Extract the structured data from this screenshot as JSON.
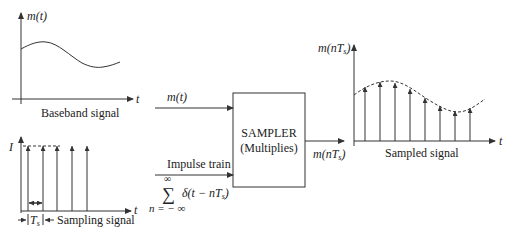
{
  "baseband": {
    "y_label": "m(t)",
    "x_label": "t",
    "caption": "Baseband signal"
  },
  "sampling": {
    "amplitude_label": "I",
    "x_label": "t",
    "period_label": "T",
    "period_sub": "s",
    "caption": "Sampling signal"
  },
  "inputs": {
    "signal_label": "m(t)",
    "impulse_label": "Impulse train",
    "sum_symbol": "∑",
    "sum_upper": "∞",
    "sum_lower": "n = − ∞",
    "delta_expr_pre": "δ(t − nT",
    "delta_expr_sub": "s",
    "delta_expr_post": ")"
  },
  "sampler": {
    "title": "SAMPLER",
    "subtitle": "(Multiplies)"
  },
  "output": {
    "label_pre": "m(nT",
    "label_sub": "s",
    "label_post": ")"
  },
  "sampled": {
    "y_label_pre": "m(nT",
    "y_label_sub": "s",
    "y_label_post": ")",
    "x_label": "t",
    "caption": "Sampled signal"
  },
  "colors": {
    "stroke": "#333333",
    "text": "#222222",
    "background": "#ffffff"
  }
}
